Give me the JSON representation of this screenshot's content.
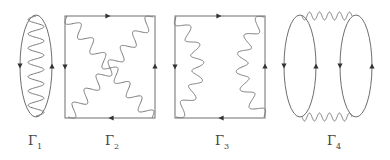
{
  "colors": {
    "line": "#6e6e6e",
    "wave": "#7a7a7a",
    "arrow": "#333333",
    "background": "#ffffff"
  },
  "diagrams": [
    {
      "id": "gamma1",
      "label": {
        "symbol": "Γ",
        "subscript": "1",
        "x": 35
      },
      "fermion_loops": [
        {
          "shape": "ellipse",
          "cx": 36,
          "cy": 66,
          "rx": 16,
          "ry": 51
        }
      ],
      "arrows": [
        {
          "x": 20,
          "y": 66,
          "dir": "down"
        },
        {
          "x": 52,
          "y": 66,
          "dir": "up"
        }
      ],
      "photons": [
        {
          "points": [
            [
              36,
              16
            ],
            [
              36,
              116
            ]
          ],
          "waves": 7,
          "amp": 8
        }
      ]
    },
    {
      "id": "gamma2",
      "label": {
        "symbol": "Γ",
        "subscript": "2",
        "x": 112
      },
      "fermion_loops": [
        {
          "shape": "rect",
          "x": 65,
          "y": 16,
          "w": 90,
          "h": 102
        }
      ],
      "arrows": [
        {
          "x": 108,
          "y": 16,
          "dir": "right"
        },
        {
          "x": 65,
          "y": 67,
          "dir": "down"
        },
        {
          "x": 155,
          "y": 66,
          "dir": "up"
        },
        {
          "x": 111,
          "y": 118,
          "dir": "left"
        }
      ],
      "photons": [
        {
          "points": [
            [
              67,
              16
            ],
            [
              110,
              68
            ],
            [
              152,
              118
            ]
          ],
          "waves": 7,
          "amp": 6
        },
        {
          "points": [
            [
              153,
              17
            ],
            [
              110,
              68
            ],
            [
              68,
              117
            ]
          ],
          "waves": 7,
          "amp": 6
        }
      ]
    },
    {
      "id": "gamma3",
      "label": {
        "symbol": "Γ",
        "subscript": "3",
        "x": 222
      },
      "fermion_loops": [
        {
          "shape": "rect",
          "x": 175,
          "y": 16,
          "w": 90,
          "h": 102
        }
      ],
      "arrows": [
        {
          "x": 219,
          "y": 16,
          "dir": "right"
        },
        {
          "x": 175,
          "y": 67,
          "dir": "down"
        },
        {
          "x": 265,
          "y": 66,
          "dir": "up"
        },
        {
          "x": 221,
          "y": 118,
          "dir": "left"
        }
      ],
      "photons": [
        {
          "points": [
            [
              176,
              17
            ],
            [
              198,
              67
            ],
            [
              176,
              117
            ]
          ],
          "waves": 6,
          "amp": 6
        },
        {
          "points": [
            [
              264,
              17
            ],
            [
              242,
              67
            ],
            [
              264,
              117
            ]
          ],
          "waves": 6,
          "amp": 6
        }
      ]
    },
    {
      "id": "gamma4",
      "label": {
        "symbol": "Γ",
        "subscript": "4",
        "x": 334
      },
      "fermion_loops": [
        {
          "shape": "ellipse",
          "cx": 300,
          "cy": 66,
          "rx": 16,
          "ry": 51
        },
        {
          "shape": "ellipse",
          "cx": 356,
          "cy": 66,
          "rx": 16,
          "ry": 51
        }
      ],
      "arrows": [
        {
          "x": 284,
          "y": 66,
          "dir": "down"
        },
        {
          "x": 316,
          "y": 66,
          "dir": "up"
        },
        {
          "x": 340,
          "y": 66,
          "dir": "down"
        },
        {
          "x": 372,
          "y": 66,
          "dir": "up"
        }
      ],
      "photons": [
        {
          "points": [
            [
              302,
              16
            ],
            [
              352,
              16
            ]
          ],
          "waves": 5,
          "amp": 4
        },
        {
          "points": [
            [
              302,
              117
            ],
            [
              352,
              117
            ]
          ],
          "waves": 5,
          "amp": 4
        }
      ]
    }
  ]
}
